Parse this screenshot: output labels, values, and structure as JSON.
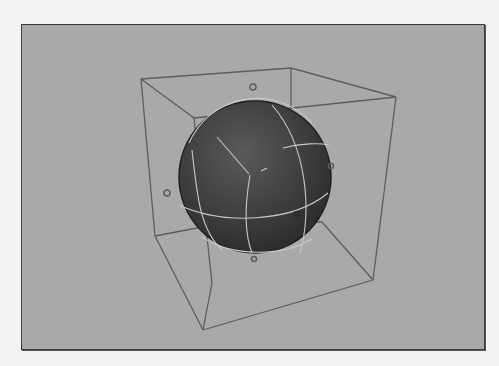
{
  "viewport": {
    "label": "3D Viewport",
    "background_color": "#a9a9a9",
    "border_color": "#3a3a3a"
  },
  "scene": {
    "objects": [
      {
        "name": "sphere",
        "type": "NURBS sphere",
        "fill_color": "#3c3c3c",
        "isoparm_color": "#c8c8c8",
        "center": [
          233,
          152
        ],
        "radius": 76
      },
      {
        "name": "lattice-cage",
        "type": "wireframe cube",
        "edge_color": "#5a5a5a"
      }
    ],
    "control_points": [
      {
        "id": "cp-top",
        "x": 231,
        "y": 62
      },
      {
        "id": "cp-left",
        "x": 145,
        "y": 168
      },
      {
        "id": "cp-right",
        "x": 309,
        "y": 141
      },
      {
        "id": "cp-front",
        "x": 275,
        "y": 189
      },
      {
        "id": "cp-bottom",
        "x": 232,
        "y": 234
      }
    ]
  }
}
